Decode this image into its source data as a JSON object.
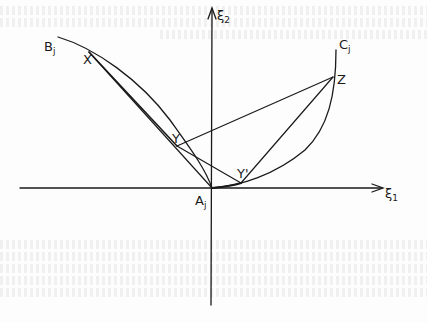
{
  "figure": {
    "axes": {
      "horizontal_label": "ξ",
      "horizontal_subscript": "1",
      "vertical_label": "ξ",
      "vertical_subscript": "2"
    },
    "points": {
      "Bj": {
        "label": "B",
        "subscript": "j"
      },
      "Cj": {
        "label": "C",
        "subscript": "j"
      },
      "Aj": {
        "label": "A",
        "subscript": "j"
      },
      "X": {
        "label": "X"
      },
      "Y": {
        "label": "Y"
      },
      "Yprime": {
        "label": "Y'"
      },
      "Z": {
        "label": "Z"
      }
    },
    "colors": {
      "ink": "#1a1a1a",
      "paper": "#fdfdfd"
    }
  }
}
